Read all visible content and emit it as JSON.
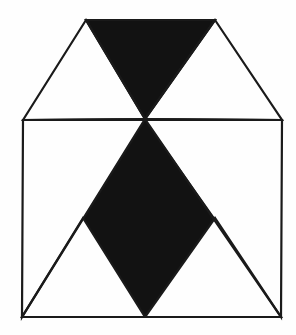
{
  "figure": {
    "canvas": {
      "width": 296,
      "height": 335,
      "background_color": "#fefefe"
    },
    "style": {
      "stroke_color": "#1a1a1a",
      "fill_color": "#121212",
      "empty_fill_color": "#ffffff",
      "stroke_width": 2.2
    },
    "vertices": {
      "top_left": [
        86,
        20
      ],
      "top_right": [
        215,
        20
      ],
      "mid_left": [
        23,
        120
      ],
      "mid_center": [
        145,
        119
      ],
      "mid_right": [
        282,
        120
      ],
      "low_left_cross": [
        83,
        218
      ],
      "low_right_cross": [
        215,
        218
      ],
      "bottom_left": [
        22,
        317
      ],
      "bottom_center": [
        145,
        317
      ],
      "bottom_right": [
        281,
        317
      ]
    },
    "shapes": [
      {
        "name": "upper-left-triangle",
        "fill": "none",
        "points": "23,120 86,20 145,119"
      },
      {
        "name": "upper-middle-triangle",
        "fill": "black",
        "points": "86,20 215,20 145,119"
      },
      {
        "name": "upper-right-triangle",
        "fill": "none",
        "points": "215,20 282,120 145,119"
      },
      {
        "name": "lower-left-triangle",
        "fill": "none",
        "points": "23,120 145,119 22,317"
      },
      {
        "name": "lower-right-triangle",
        "fill": "none",
        "points": "145,119 282,120 281,317"
      },
      {
        "name": "lower-left-base-triangle",
        "fill": "none",
        "points": "22,317 145,317 83,218"
      },
      {
        "name": "lower-right-base-triangle",
        "fill": "none",
        "points": "145,317 281,317 215,218"
      },
      {
        "name": "central-black-rhombus",
        "fill": "black",
        "points": "145,119 215,218 145,317 83,218"
      }
    ],
    "edges": [
      {
        "name": "middle-horizontal-line",
        "from": [
          23,
          120
        ],
        "to": [
          282,
          120
        ]
      },
      {
        "name": "bottom-horizontal-line",
        "from": [
          22,
          317
        ],
        "to": [
          281,
          317
        ]
      },
      {
        "name": "top-horizontal-line",
        "from": [
          86,
          20
        ],
        "to": [
          215,
          20
        ]
      }
    ]
  }
}
